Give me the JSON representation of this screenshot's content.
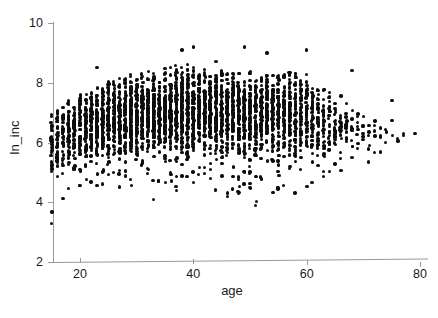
{
  "chart_data": {
    "type": "scatter",
    "title": "",
    "xlabel": "age",
    "ylabel": "ln_inc",
    "xlim": [
      13,
      82
    ],
    "ylim": [
      2,
      10
    ],
    "xticks": [
      20,
      40,
      60,
      80
    ],
    "yticks": [
      2,
      4,
      6,
      8,
      10
    ],
    "xtick_labels": [
      "20",
      "40",
      "60",
      "80"
    ],
    "ytick_labels": [
      "2",
      "4",
      "6",
      "8",
      "10"
    ],
    "grid": false,
    "legend": null,
    "marker": {
      "shape": "circle",
      "color": "#0d0d0d",
      "size_px": 3.4,
      "filled": true
    },
    "columns": [
      {
        "age": 15,
        "n": 26,
        "lo": 3.3,
        "hi": 7.0,
        "q1": 5.3,
        "q3": 6.5,
        "median": 6.0
      },
      {
        "age": 16,
        "n": 34,
        "lo": 4.2,
        "hi": 7.1,
        "q1": 5.4,
        "q3": 6.6,
        "median": 6.1
      },
      {
        "age": 17,
        "n": 40,
        "lo": 4.1,
        "hi": 7.3,
        "q1": 5.5,
        "q3": 6.7,
        "median": 6.2
      },
      {
        "age": 18,
        "n": 46,
        "lo": 4.3,
        "hi": 7.4,
        "q1": 5.6,
        "q3": 6.9,
        "median": 6.3
      },
      {
        "age": 19,
        "n": 52,
        "lo": 4.4,
        "hi": 7.5,
        "q1": 5.7,
        "q3": 7.0,
        "median": 6.4
      },
      {
        "age": 20,
        "n": 58,
        "lo": 4.4,
        "hi": 7.6,
        "q1": 5.8,
        "q3": 7.1,
        "median": 6.5
      },
      {
        "age": 21,
        "n": 62,
        "lo": 4.5,
        "hi": 7.7,
        "q1": 5.8,
        "q3": 7.2,
        "median": 6.5
      },
      {
        "age": 22,
        "n": 66,
        "lo": 4.6,
        "hi": 7.8,
        "q1": 5.9,
        "q3": 7.2,
        "median": 6.6
      },
      {
        "age": 23,
        "n": 70,
        "lo": 4.5,
        "hi": 7.9,
        "q1": 5.9,
        "q3": 7.3,
        "median": 6.6
      },
      {
        "age": 24,
        "n": 74,
        "lo": 4.6,
        "hi": 8.0,
        "q1": 6.0,
        "q3": 7.3,
        "median": 6.7
      },
      {
        "age": 25,
        "n": 78,
        "lo": 4.6,
        "hi": 8.1,
        "q1": 6.0,
        "q3": 7.4,
        "median": 6.7
      },
      {
        "age": 26,
        "n": 80,
        "lo": 4.7,
        "hi": 8.1,
        "q1": 6.0,
        "q3": 7.4,
        "median": 6.8
      },
      {
        "age": 27,
        "n": 82,
        "lo": 4.5,
        "hi": 8.2,
        "q1": 6.1,
        "q3": 7.4,
        "median": 6.8
      },
      {
        "age": 28,
        "n": 84,
        "lo": 4.6,
        "hi": 8.2,
        "q1": 6.1,
        "q3": 7.5,
        "median": 6.8
      },
      {
        "age": 29,
        "n": 84,
        "lo": 4.4,
        "hi": 8.3,
        "q1": 6.1,
        "q3": 7.5,
        "median": 6.8
      },
      {
        "age": 30,
        "n": 86,
        "lo": 4.7,
        "hi": 8.3,
        "q1": 6.1,
        "q3": 7.5,
        "median": 6.9
      },
      {
        "age": 31,
        "n": 86,
        "lo": 4.6,
        "hi": 8.3,
        "q1": 6.1,
        "q3": 7.5,
        "median": 6.9
      },
      {
        "age": 32,
        "n": 88,
        "lo": 4.5,
        "hi": 8.4,
        "q1": 6.2,
        "q3": 7.6,
        "median": 6.9
      },
      {
        "age": 33,
        "n": 88,
        "lo": 4.7,
        "hi": 8.4,
        "q1": 6.2,
        "q3": 7.6,
        "median": 6.9
      },
      {
        "age": 34,
        "n": 88,
        "lo": 4.4,
        "hi": 8.5,
        "q1": 6.2,
        "q3": 7.6,
        "median": 6.9
      },
      {
        "age": 35,
        "n": 90,
        "lo": 4.6,
        "hi": 8.5,
        "q1": 6.2,
        "q3": 7.6,
        "median": 7.0
      },
      {
        "age": 36,
        "n": 90,
        "lo": 4.5,
        "hi": 8.6,
        "q1": 6.2,
        "q3": 7.6,
        "median": 7.0
      },
      {
        "age": 37,
        "n": 88,
        "lo": 4.3,
        "hi": 8.6,
        "q1": 6.2,
        "q3": 7.7,
        "median": 7.0
      },
      {
        "age": 38,
        "n": 88,
        "lo": 4.6,
        "hi": 8.7,
        "q1": 6.2,
        "q3": 7.7,
        "median": 7.0
      },
      {
        "age": 39,
        "n": 88,
        "lo": 4.5,
        "hi": 8.7,
        "q1": 6.2,
        "q3": 7.7,
        "median": 7.0
      },
      {
        "age": 40,
        "n": 88,
        "lo": 4.6,
        "hi": 8.6,
        "q1": 6.2,
        "q3": 7.7,
        "median": 7.0
      },
      {
        "age": 41,
        "n": 86,
        "lo": 4.4,
        "hi": 8.5,
        "q1": 6.2,
        "q3": 7.7,
        "median": 7.0
      },
      {
        "age": 42,
        "n": 86,
        "lo": 4.5,
        "hi": 8.5,
        "q1": 6.2,
        "q3": 7.7,
        "median": 7.0
      },
      {
        "age": 43,
        "n": 86,
        "lo": 4.4,
        "hi": 8.5,
        "q1": 6.2,
        "q3": 7.7,
        "median": 7.0
      },
      {
        "age": 44,
        "n": 84,
        "lo": 4.3,
        "hi": 8.5,
        "q1": 6.2,
        "q3": 7.7,
        "median": 7.0
      },
      {
        "age": 45,
        "n": 84,
        "lo": 4.5,
        "hi": 8.4,
        "q1": 6.2,
        "q3": 7.7,
        "median": 7.0
      },
      {
        "age": 46,
        "n": 82,
        "lo": 4.3,
        "hi": 8.4,
        "q1": 6.2,
        "q3": 7.7,
        "median": 7.0
      },
      {
        "age": 47,
        "n": 82,
        "lo": 4.4,
        "hi": 8.4,
        "q1": 6.2,
        "q3": 7.7,
        "median": 7.0
      },
      {
        "age": 48,
        "n": 80,
        "lo": 4.2,
        "hi": 8.4,
        "q1": 6.2,
        "q3": 7.7,
        "median": 7.0
      },
      {
        "age": 49,
        "n": 80,
        "lo": 4.3,
        "hi": 8.4,
        "q1": 6.1,
        "q3": 7.6,
        "median": 6.9
      },
      {
        "age": 50,
        "n": 78,
        "lo": 4.2,
        "hi": 8.4,
        "q1": 6.1,
        "q3": 7.6,
        "median": 6.9
      },
      {
        "age": 51,
        "n": 78,
        "lo": 3.9,
        "hi": 8.3,
        "q1": 6.1,
        "q3": 7.6,
        "median": 6.9
      },
      {
        "age": 52,
        "n": 76,
        "lo": 4.2,
        "hi": 8.3,
        "q1": 6.1,
        "q3": 7.6,
        "median": 6.9
      },
      {
        "age": 53,
        "n": 74,
        "lo": 4.3,
        "hi": 8.3,
        "q1": 6.1,
        "q3": 7.6,
        "median": 6.9
      },
      {
        "age": 54,
        "n": 72,
        "lo": 4.2,
        "hi": 8.3,
        "q1": 6.1,
        "q3": 7.6,
        "median": 6.9
      },
      {
        "age": 55,
        "n": 70,
        "lo": 4.4,
        "hi": 8.3,
        "q1": 6.1,
        "q3": 7.6,
        "median": 6.9
      },
      {
        "age": 56,
        "n": 68,
        "lo": 4.3,
        "hi": 8.4,
        "q1": 6.1,
        "q3": 7.6,
        "median": 6.9
      },
      {
        "age": 57,
        "n": 64,
        "lo": 4.4,
        "hi": 8.4,
        "q1": 6.1,
        "q3": 7.6,
        "median": 6.9
      },
      {
        "age": 58,
        "n": 60,
        "lo": 4.3,
        "hi": 8.4,
        "q1": 6.0,
        "q3": 7.6,
        "median": 6.9
      },
      {
        "age": 59,
        "n": 56,
        "lo": 4.4,
        "hi": 8.3,
        "q1": 6.0,
        "q3": 7.5,
        "median": 6.8
      },
      {
        "age": 60,
        "n": 52,
        "lo": 4.3,
        "hi": 8.3,
        "q1": 6.0,
        "q3": 7.5,
        "median": 6.8
      },
      {
        "age": 61,
        "n": 46,
        "lo": 4.4,
        "hi": 8.2,
        "q1": 6.0,
        "q3": 7.5,
        "median": 6.8
      },
      {
        "age": 62,
        "n": 40,
        "lo": 4.5,
        "hi": 8.1,
        "q1": 5.9,
        "q3": 7.4,
        "median": 6.7
      },
      {
        "age": 63,
        "n": 34,
        "lo": 4.4,
        "hi": 8.0,
        "q1": 5.9,
        "q3": 7.3,
        "median": 6.7
      },
      {
        "age": 64,
        "n": 28,
        "lo": 4.5,
        "hi": 7.9,
        "q1": 5.9,
        "q3": 7.2,
        "median": 6.6
      },
      {
        "age": 65,
        "n": 24,
        "lo": 4.6,
        "hi": 7.8,
        "q1": 5.9,
        "q3": 7.2,
        "median": 6.6
      },
      {
        "age": 66,
        "n": 18,
        "lo": 4.7,
        "hi": 7.6,
        "q1": 5.8,
        "q3": 7.1,
        "median": 6.5
      },
      {
        "age": 67,
        "n": 14,
        "lo": 4.8,
        "hi": 7.5,
        "q1": 5.8,
        "q3": 7.0,
        "median": 6.5
      },
      {
        "age": 68,
        "n": 11,
        "lo": 5.0,
        "hi": 7.4,
        "q1": 5.8,
        "q3": 7.0,
        "median": 6.4
      },
      {
        "age": 69,
        "n": 9,
        "lo": 5.1,
        "hi": 7.3,
        "q1": 5.8,
        "q3": 6.9,
        "median": 6.4
      },
      {
        "age": 70,
        "n": 8,
        "lo": 5.2,
        "hi": 7.2,
        "q1": 5.8,
        "q3": 6.9,
        "median": 6.4
      },
      {
        "age": 71,
        "n": 6,
        "lo": 5.3,
        "hi": 7.1,
        "q1": 5.8,
        "q3": 6.8,
        "median": 6.3
      },
      {
        "age": 72,
        "n": 5,
        "lo": 5.4,
        "hi": 7.0,
        "q1": 5.9,
        "q3": 6.8,
        "median": 6.3
      },
      {
        "age": 73,
        "n": 4,
        "lo": 5.5,
        "hi": 6.9,
        "q1": 5.9,
        "q3": 6.7,
        "median": 6.3
      },
      {
        "age": 74,
        "n": 3,
        "lo": 5.8,
        "hi": 6.8,
        "q1": 6.0,
        "q3": 6.6,
        "median": 6.3
      },
      {
        "age": 75,
        "n": 3,
        "lo": 5.9,
        "hi": 7.4,
        "q1": 6.1,
        "q3": 6.9,
        "median": 6.4
      },
      {
        "age": 76,
        "n": 2,
        "lo": 6.0,
        "hi": 6.5,
        "q1": 6.1,
        "q3": 6.4,
        "median": 6.2
      },
      {
        "age": 77,
        "n": 2,
        "lo": 6.1,
        "hi": 6.6,
        "q1": 6.2,
        "q3": 6.5,
        "median": 6.3
      },
      {
        "age": 79,
        "n": 1,
        "lo": 6.3,
        "hi": 6.3,
        "q1": 6.3,
        "q3": 6.3,
        "median": 6.3
      }
    ],
    "outliers_high": [
      {
        "age": 23,
        "ln_inc": 8.5
      },
      {
        "age": 38,
        "ln_inc": 9.1
      },
      {
        "age": 40,
        "ln_inc": 9.2
      },
      {
        "age": 44,
        "ln_inc": 8.7
      },
      {
        "age": 49,
        "ln_inc": 9.2
      },
      {
        "age": 53,
        "ln_inc": 9.0
      },
      {
        "age": 60,
        "ln_inc": 9.1
      },
      {
        "age": 68,
        "ln_inc": 8.4
      }
    ],
    "outliers_low": [
      {
        "age": 15,
        "ln_inc": 3.3
      },
      {
        "age": 51,
        "ln_inc": 3.9
      },
      {
        "age": 33,
        "ln_inc": 4.1
      },
      {
        "age": 46,
        "ln_inc": 4.2
      }
    ]
  }
}
